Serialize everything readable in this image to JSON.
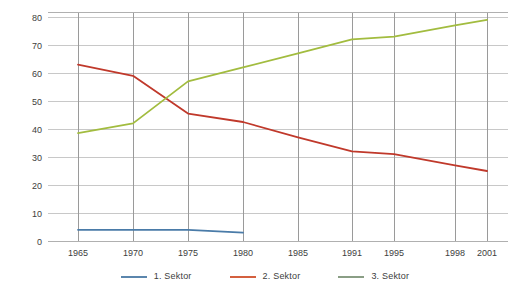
{
  "chart_data": {
    "type": "line",
    "title": "",
    "subtitle": "",
    "xlabel": "",
    "ylabel": "",
    "x": [
      1965,
      1970,
      1975,
      1980,
      1985,
      1991,
      1995,
      1998,
      2001
    ],
    "xtick_labels": [
      "1965",
      "1970",
      "1975",
      "1980",
      "1985",
      "1991",
      "1995",
      "1998",
      "2001"
    ],
    "ytick_labels": [
      "0",
      "10",
      "20",
      "30",
      "40",
      "50",
      "60",
      "70",
      "80"
    ],
    "yticks": [
      0,
      10,
      20,
      30,
      40,
      50,
      60,
      70,
      80
    ],
    "ylim": [
      0,
      85
    ],
    "grid": "both",
    "legend_position": "bottom",
    "series": [
      {
        "name": "1. Sektor",
        "color": "#4a7ba8",
        "x": [
          1965,
          1970,
          1975,
          1980
        ],
        "values": [
          4,
          4,
          4,
          3
        ]
      },
      {
        "name": "2. Sektor",
        "color": "#c0392b",
        "x": [
          1965,
          1970,
          1975,
          1980,
          1985,
          1991,
          1995,
          1998,
          2001
        ],
        "values": [
          63,
          59,
          45.5,
          42.5,
          37,
          32,
          31,
          27,
          25
        ]
      },
      {
        "name": "3. Sektor",
        "color": "#a2bc3f",
        "x": [
          1965,
          1970,
          1975,
          1980,
          1985,
          1991,
          1995,
          1998,
          2001
        ],
        "values": [
          38.5,
          42,
          57,
          62,
          67,
          72,
          73,
          77,
          79
        ]
      }
    ]
  },
  "legend": {
    "items": [
      {
        "label": "1. Sektor",
        "color": "#5b86ad"
      },
      {
        "label": "2. Sektor",
        "color": "#d4603f"
      },
      {
        "label": "3. Sektor",
        "color": "#8a9e85"
      }
    ]
  }
}
